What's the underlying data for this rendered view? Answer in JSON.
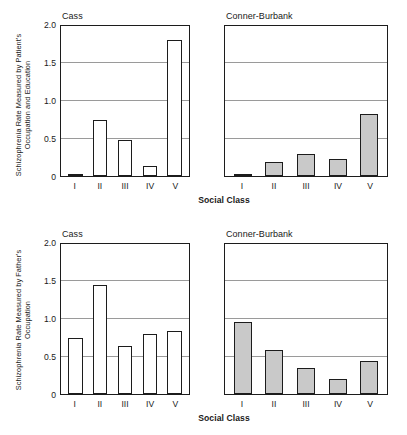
{
  "chart_data": [
    {
      "type": "bar",
      "title": "Schizophrenia Rate Measured by Patient's Occupation and Education",
      "ylabel": "Schizophrenia Rate Measured by Patient's Occupation and Education",
      "xlabel": "Social Class",
      "categories": [
        "I",
        "II",
        "III",
        "IV",
        "V"
      ],
      "ylim": [
        0,
        2.0
      ],
      "yticks": [
        "0",
        "0.5",
        "1.0",
        "1.5",
        "2.0"
      ],
      "ytick_values": [
        0,
        0.5,
        1.0,
        1.5,
        2.0
      ],
      "grid": true,
      "legend": "none",
      "panels": [
        {
          "name": "Cass",
          "fill": "#ffffff",
          "values": [
            0.01,
            0.755,
            0.48,
            0.14,
            1.83
          ]
        },
        {
          "name": "Conner-Burbank",
          "fill": "#c9c9c9",
          "values": [
            0.01,
            0.19,
            0.295,
            0.225,
            0.835
          ]
        }
      ]
    },
    {
      "type": "bar",
      "title": "Schizophrenia Rate Measured by Father's Occupation",
      "ylabel": "Schizophrenia Rate Measured by Father's Occupation",
      "xlabel": "Social Class",
      "categories": [
        "I",
        "II",
        "III",
        "IV",
        "V"
      ],
      "ylim": [
        0,
        2.0
      ],
      "yticks": [
        "0",
        "0.5",
        "1.0",
        "1.5",
        "2.0"
      ],
      "ytick_values": [
        0,
        0.5,
        1.0,
        1.5,
        2.0
      ],
      "grid": true,
      "legend": "none",
      "panels": [
        {
          "name": "Cass",
          "fill": "#ffffff",
          "values": [
            0.75,
            1.47,
            0.64,
            0.8,
            0.85
          ]
        },
        {
          "name": "Conner-Burbank",
          "fill": "#c9c9c9",
          "values": [
            0.97,
            0.59,
            0.35,
            0.2,
            0.45
          ]
        }
      ]
    }
  ]
}
